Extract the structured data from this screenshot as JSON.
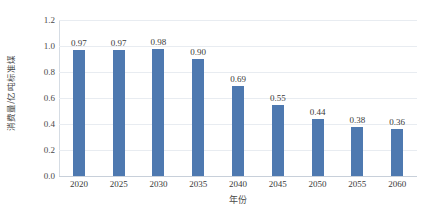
{
  "chart_data": {
    "type": "bar",
    "title": "",
    "subtitle": "",
    "xlabel": "年份",
    "ylabel": "消费量/亿吨标准煤",
    "categories": [
      "2020",
      "2025",
      "2030",
      "2035",
      "2040",
      "2045",
      "2050",
      "2055",
      "2060"
    ],
    "values": [
      0.97,
      0.97,
      0.98,
      0.9,
      0.69,
      0.55,
      0.44,
      0.38,
      0.36
    ],
    "value_labels": [
      "0.97",
      "0.97",
      "0.98",
      "0.90",
      "0.69",
      "0.55",
      "0.44",
      "0.38",
      "0.36"
    ],
    "ylim": [
      0.0,
      1.2
    ],
    "ytick_labels": [
      "0.0",
      "0.2",
      "0.4",
      "0.6",
      "0.8",
      "1.0",
      "1.2"
    ],
    "ytick_values": [
      0.0,
      0.2,
      0.4,
      0.6,
      0.8,
      1.0,
      1.2
    ],
    "grid": true,
    "grid_axis": "y",
    "legend": false,
    "legend_position": "none",
    "series": [
      {
        "name": "消费量",
        "color": "#4E79B0",
        "values": [
          0.97,
          0.97,
          0.98,
          0.9,
          0.69,
          0.55,
          0.44,
          0.38,
          0.36
        ]
      }
    ],
    "colors": {
      "bar": "#4E79B0",
      "gridline": "#E8ECF1",
      "axis": "#C8D0DA",
      "text": "#3A3A3A",
      "background": "#FFFFFF"
    }
  }
}
